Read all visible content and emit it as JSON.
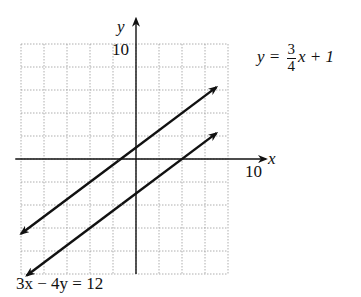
{
  "chart_data": {
    "type": "line",
    "title": "",
    "xlabel": "x",
    "ylabel": "y",
    "xlim": [
      -10,
      10
    ],
    "ylim": [
      -10,
      10
    ],
    "grid": true,
    "grid_step": 2,
    "tick_labels": {
      "x": [
        "10"
      ],
      "y": [
        "10"
      ]
    },
    "series": [
      {
        "name": "y = 3/4 x + 1",
        "equation": "y = (3/4)x + 1",
        "slope": 0.75,
        "intercept": 1,
        "x": [
          -10,
          7
        ],
        "y": [
          -6.5,
          6.25
        ]
      },
      {
        "name": "3x − 4y = 12",
        "equation": "3x - 4y = 12",
        "slope": 0.75,
        "intercept": -3,
        "x": [
          -9.5,
          7
        ],
        "y": [
          -10.125,
          2.25
        ]
      }
    ],
    "annotations": [
      {
        "text": "y = 3/4 x + 1",
        "position": "upper-right"
      },
      {
        "text": "3x − 4y = 12",
        "position": "bottom-left"
      }
    ]
  },
  "labels": {
    "y_axis": "y",
    "x_axis": "x",
    "y_tick": "10",
    "x_tick": "10",
    "line1_lhs": "y = ",
    "line1_num": "3",
    "line1_den": "4",
    "line1_rhs": "x + 1",
    "line2": "3x − 4y = 12"
  }
}
